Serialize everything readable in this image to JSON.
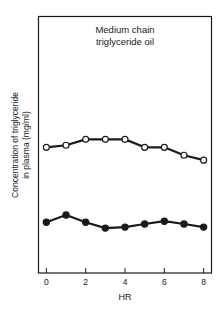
{
  "chart_data": {
    "type": "line",
    "title": "Medium chain triglyceride oil",
    "title_lines": [
      "Medium chain",
      "triglyceride oil"
    ],
    "xlabel": "HR",
    "ylabel_lines": [
      "Concentration of triglyceride",
      "in plasma (mg/ml)"
    ],
    "xlim": [
      -0.4,
      8.4
    ],
    "ylim": [
      0,
      100
    ],
    "y_units_note": "relative (no y tick labels shown)",
    "x_ticks": [
      0,
      2,
      4,
      6,
      8
    ],
    "x_tick_labels": [
      "0",
      "2",
      "4",
      "6",
      "8"
    ],
    "x": [
      0,
      1,
      2,
      3,
      4,
      5,
      6,
      7,
      8
    ],
    "grid": false,
    "legend": "none",
    "series": [
      {
        "name": "open-circles",
        "marker": "open-circle",
        "values": [
          49.0,
          49.8,
          52.1,
          52.1,
          52.1,
          49.0,
          49.0,
          45.9,
          44.0
        ]
      },
      {
        "name": "filled-circles",
        "marker": "filled-circle",
        "values": [
          19.8,
          22.6,
          19.8,
          17.5,
          17.9,
          19.1,
          20.2,
          19.1,
          17.9
        ]
      }
    ],
    "colors": {
      "ink": "#1a1a1a",
      "background": "#ffffff"
    }
  }
}
